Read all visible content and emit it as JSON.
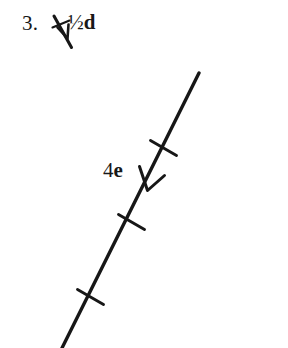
{
  "figure": {
    "background_color": "#ffffff",
    "ink_color": "#171717",
    "width": 288,
    "height": 348,
    "item_number": "3.",
    "labels": {
      "reference_vector": {
        "coefficient": "½",
        "symbol": "d",
        "full_text": "½d"
      },
      "main_vector": {
        "coefficient": "4",
        "symbol": "e",
        "full_text": "4e"
      }
    },
    "icons": {
      "reference_arrow": "down-right-arrow-icon",
      "main_arrow": "down-left-arrowhead-icon",
      "tick": "tick-mark-icon"
    },
    "geometry": {
      "reference_arrow": {
        "x1": 54,
        "y1": 16,
        "x2": 71,
        "y2": 47,
        "tick": {
          "x1": 53,
          "y1": 27,
          "x2": 70,
          "y2": 21
        }
      },
      "main_line": {
        "x1": 199,
        "y1": 73,
        "x2": 62,
        "y2": 348
      },
      "main_arrowhead": {
        "tip_x": 144,
        "tip_y": 190,
        "left_x": 140,
        "left_y": 167,
        "right_x": 163,
        "right_y": 176
      },
      "tick_marks": [
        {
          "cx": 163,
          "cy": 148
        },
        {
          "cx": 131,
          "cy": 222
        },
        {
          "cx": 90,
          "cy": 297
        }
      ]
    }
  }
}
